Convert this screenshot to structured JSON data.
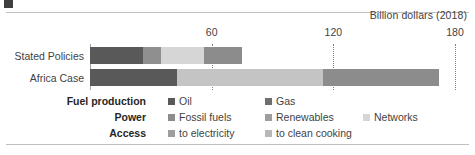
{
  "chart_data": {
    "type": "bar",
    "orientation": "horizontal",
    "stacked": true,
    "title": "",
    "axis_title": "Billion dollars (2018)",
    "xlabel": "Billion dollars (2018)",
    "ylabel": "",
    "xlim": [
      0,
      180
    ],
    "ticks": [
      {
        "value": 60,
        "label": "60"
      },
      {
        "value": 120,
        "label": "120"
      },
      {
        "value": 180,
        "label": "180"
      }
    ],
    "grid": "dotted vertical gridlines at 60, 120, 180",
    "legend_position": "bottom",
    "categories": [
      "Stated Policies",
      "Africa Case"
    ],
    "series": [
      {
        "name": "Oil",
        "group": "Fuel production",
        "color": "#595959",
        "values": [
          26,
          43
        ]
      },
      {
        "name": "Gas",
        "group": "Fuel production",
        "color": "#808080",
        "values": [
          9,
          0
        ]
      },
      {
        "name": "Fossil fuels",
        "group": "Power",
        "color": "#a6a6a6",
        "values": [
          0,
          0
        ]
      },
      {
        "name": "Renewables",
        "group": "Power",
        "color": "#b3b3b3",
        "values": [
          0,
          29
        ]
      },
      {
        "name": "Networks",
        "group": "Power",
        "color": "#d9d9d9",
        "values": [
          20,
          0
        ]
      },
      {
        "name": "to electricity",
        "group": "Access",
        "color": "#8c8c8c",
        "values": [
          19,
          43
        ]
      },
      {
        "name": "to clean cooking",
        "group": "Access",
        "color": "#bfbfbf",
        "values": [
          0,
          57
        ]
      }
    ],
    "totals": [
      75,
      172
    ]
  },
  "axis": {
    "title": "Billion dollars (2018)",
    "tick_labels": [
      "60",
      "120",
      "180"
    ]
  },
  "bars": {
    "rows": [
      {
        "label": "Stated Policies",
        "segments": [
          {
            "name": "Oil",
            "start": 0,
            "end": 26,
            "color": "#595959"
          },
          {
            "name": "Gas",
            "start": 26,
            "end": 35,
            "color": "#8f8f8f"
          },
          {
            "name": "Networks",
            "start": 35,
            "end": 56,
            "color": "#d6d6d6"
          },
          {
            "name": "Fossil fuels",
            "start": 56,
            "end": 75,
            "color": "#8c8c8c"
          }
        ]
      },
      {
        "label": "Africa Case",
        "segments": [
          {
            "name": "Oil",
            "start": 0,
            "end": 43,
            "color": "#595959"
          },
          {
            "name": "to clean cooking",
            "start": 43,
            "end": 115,
            "color": "#c4c4c4"
          },
          {
            "name": "Fossil fuels",
            "start": 115,
            "end": 172,
            "color": "#8c8c8c"
          }
        ]
      }
    ]
  },
  "legend": {
    "rows": [
      {
        "group": "Fuel production",
        "items": [
          {
            "label": "Oil",
            "color": "#595959"
          },
          {
            "label": "Gas",
            "color": "#6e6e6e"
          }
        ]
      },
      {
        "group": "Power",
        "items": [
          {
            "label": "Fossil fuels",
            "color": "#8c8c8c"
          },
          {
            "label": "Renewables",
            "color": "#9e9e9e"
          },
          {
            "label": "Networks",
            "color": "#d6d6d6"
          }
        ]
      },
      {
        "group": "Access",
        "items": [
          {
            "label": "to electricity",
            "color": "#9e9e9e"
          },
          {
            "label": "to clean cooking",
            "color": "#b8b8b8"
          }
        ]
      }
    ]
  }
}
